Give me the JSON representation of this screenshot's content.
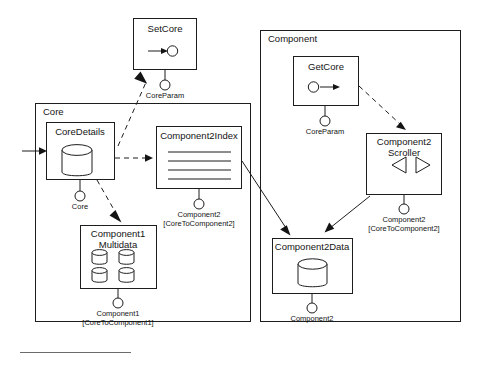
{
  "diagram": {
    "kind": "uml-component-diagram",
    "accent_color": "#1d1d1d",
    "background_color": "#ffffff"
  },
  "packages": [
    {
      "id": "core",
      "label": "Core"
    },
    {
      "id": "component",
      "label": "Component"
    }
  ],
  "components": {
    "set_core": {
      "label": "SetCore",
      "icon": "provided-interface-icon"
    },
    "get_core": {
      "label": "GetCore",
      "icon": "required-interface-icon"
    },
    "core_details": {
      "label": "CoreDetails",
      "icon": "database-cylinder-icon"
    },
    "component2_index": {
      "label": "Component2Index",
      "icon": "list-lines-icon"
    },
    "component1_multidata": {
      "label_line1": "Component1",
      "label_line2": "Multidata",
      "icon": "multi-database-icon"
    },
    "component2_scroller": {
      "label_line1": "Component2",
      "label_line2": "Scroller",
      "icon": "scroller-arrows-icon"
    },
    "component2_data": {
      "label": "Component2Data",
      "icon": "database-cylinder-icon"
    }
  },
  "interfaces": {
    "setcore_param": {
      "name": "CoreParam",
      "qualifier": ""
    },
    "getcore_param": {
      "name": "CoreParam",
      "qualifier": ""
    },
    "coredetails_core": {
      "name": "Core",
      "qualifier": ""
    },
    "index_component2": {
      "name": "Component2",
      "qualifier": "[CoreToComponent2]"
    },
    "multidata_component1": {
      "name": "Component1",
      "qualifier": "[CoreToComponent1]"
    },
    "scroller_component2": {
      "name": "Component2",
      "qualifier": "[CoreToComponent2]"
    },
    "data_component2": {
      "name": "Component2",
      "qualifier": ""
    }
  },
  "connections": [
    {
      "id": "in-to-coredetails",
      "from": "external-left",
      "to": "core_details",
      "style": "solid",
      "arrow": "filled"
    },
    {
      "id": "coredetails-to-setcore",
      "from": "core_details",
      "to": "set_core",
      "style": "dashed",
      "arrow": "filled"
    },
    {
      "id": "coredetails-to-index",
      "from": "core_details",
      "to": "component2_index",
      "style": "dashed",
      "arrow": "filled"
    },
    {
      "id": "coredetails-to-multidata",
      "from": "core_details",
      "to": "component1_multidata",
      "style": "dashed",
      "arrow": "filled"
    },
    {
      "id": "getcore-to-scroller",
      "from": "get_core",
      "to": "component2_scroller",
      "style": "dashed",
      "arrow": "filled"
    },
    {
      "id": "index-to-data",
      "from": "component2_index",
      "to": "component2_data",
      "style": "solid",
      "arrow": "filled"
    },
    {
      "id": "scroller-to-data",
      "from": "component2_scroller",
      "to": "component2_data",
      "style": "solid",
      "arrow": "filled"
    }
  ]
}
